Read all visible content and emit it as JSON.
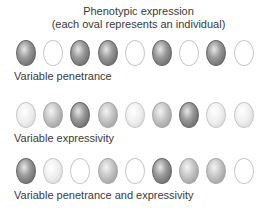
{
  "title": {
    "line1": "Phenotypic expression",
    "line2": "(each oval represents an individual)"
  },
  "rows": [
    {
      "label": "Variable penetrance",
      "ovals": [
        3,
        0,
        3,
        3,
        0,
        3,
        0,
        3,
        0
      ]
    },
    {
      "label": "Variable expressivity",
      "ovals": [
        1,
        2,
        3,
        2,
        1,
        2,
        3,
        1,
        1
      ]
    },
    {
      "label": "Variable penetrance and expressivity",
      "ovals": [
        3,
        1,
        0,
        2,
        0,
        3,
        2,
        2,
        0
      ]
    }
  ],
  "legend": {
    "shade_levels": {
      "0": "unaffected (white)",
      "1": "light",
      "2": "medium",
      "3": "dark"
    }
  }
}
